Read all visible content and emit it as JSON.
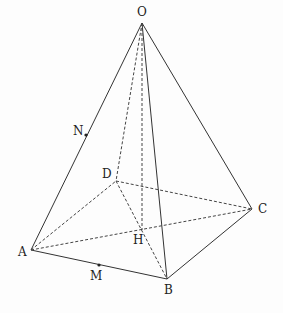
{
  "figure": {
    "points": {
      "O": {
        "label": "O",
        "x": 142,
        "y": 23,
        "lx": 137,
        "ly": 16
      },
      "A": {
        "label": "A",
        "x": 31,
        "y": 250,
        "lx": 18,
        "ly": 256
      },
      "B": {
        "label": "B",
        "x": 167,
        "y": 279,
        "lx": 164,
        "ly": 294
      },
      "C": {
        "label": "C",
        "x": 252,
        "y": 209,
        "lx": 258,
        "ly": 213
      },
      "D": {
        "label": "D",
        "x": 116,
        "y": 181,
        "lx": 102,
        "ly": 178
      },
      "H": {
        "label": "H",
        "x": 142,
        "y": 230,
        "lx": 133,
        "ly": 244
      },
      "M": {
        "label": "M",
        "x": 99,
        "y": 265,
        "lx": 90,
        "ly": 280
      },
      "N": {
        "label": "N",
        "x": 86,
        "y": 135,
        "lx": 73,
        "ly": 135
      }
    },
    "solid_edges": [
      "OA",
      "OB",
      "OC",
      "AB",
      "BC"
    ],
    "dashed_edges": [
      "OD",
      "OH",
      "AD",
      "DC",
      "AC",
      "DB"
    ]
  }
}
